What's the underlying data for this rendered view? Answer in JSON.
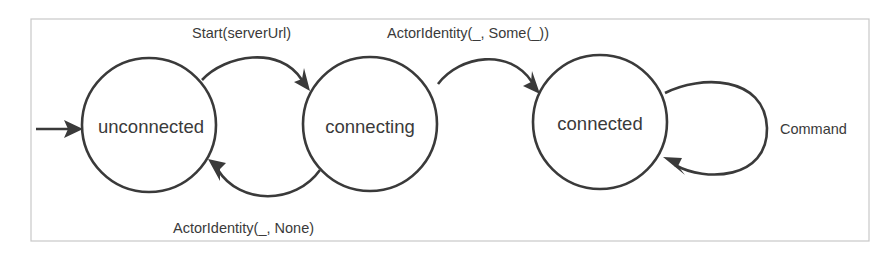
{
  "diagram": {
    "type": "state-machine",
    "states": [
      {
        "id": "unconnected",
        "label": "unconnected",
        "initial": true
      },
      {
        "id": "connecting",
        "label": "connecting"
      },
      {
        "id": "connected",
        "label": "connected"
      }
    ],
    "transitions": [
      {
        "from": "unconnected",
        "to": "connecting",
        "label": "Start(serverUrl)"
      },
      {
        "from": "connecting",
        "to": "connected",
        "label": "ActorIdentity(_, Some(_))"
      },
      {
        "from": "connecting",
        "to": "unconnected",
        "label": "ActorIdentity(_, None)"
      },
      {
        "from": "connected",
        "to": "connected",
        "label": "Command"
      }
    ],
    "colors": {
      "stroke": "#3a3a3a",
      "frame": "#c8c8c8",
      "background": "#ffffff"
    }
  }
}
